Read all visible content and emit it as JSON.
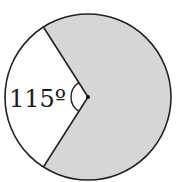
{
  "diagram": {
    "type": "circle-sector",
    "unshaded_angle_deg": 115,
    "angle_label": "115º",
    "colors": {
      "shaded": "#d6d6d6",
      "unshaded": "#ffffff",
      "stroke": "#222222"
    }
  }
}
